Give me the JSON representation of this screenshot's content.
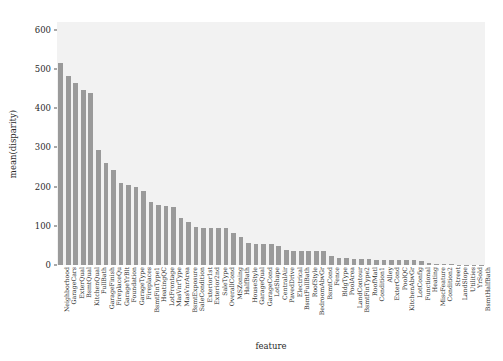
{
  "chart_data": {
    "type": "bar",
    "title": "",
    "xlabel": "feature",
    "ylabel": "mean(disparity)",
    "ylim": [
      0,
      620
    ],
    "yticks": [
      0,
      100,
      200,
      300,
      400,
      500,
      600
    ],
    "grid": false,
    "legend": null,
    "bar_color": "#9a9a9a",
    "plot_background": "#f2f2f2",
    "categories": [
      "Neighborhood",
      "GarageCars",
      "ExterQual",
      "BsmtQual",
      "KitchenQual",
      "FullBath",
      "GarageFinish",
      "FireplaceQu",
      "GarageYrBlt",
      "Foundation",
      "GarageType",
      "Fireplaces",
      "BsmtFinType1",
      "HeatingQC",
      "LotFrontage",
      "MasVnrType",
      "MasVnrArea",
      "BsmtExposure",
      "SaleCondition",
      "Exterior1st",
      "Exterior2nd",
      "SaleType",
      "OverallCond",
      "MSZoning",
      "HalfBath",
      "HouseStyle",
      "GarageQual",
      "GarageCond",
      "LotShape",
      "CentralAir",
      "PavedDrive",
      "Electrical",
      "BsmtFullBath",
      "RoofStyle",
      "BedroomAbvGr",
      "BsmtCond",
      "Fence",
      "BldgType",
      "PoolArea",
      "LandContour",
      "BsmtFinType2",
      "RoofMatl",
      "Condition1",
      "Alley",
      "ExterCond",
      "PoolQC",
      "KitchenAbvGr",
      "LotConfig",
      "Functional",
      "Heating",
      "MiscFeature",
      "Condition2",
      "Street",
      "LandSlope",
      "Utilities",
      "YrSold",
      "BsmtHalfBath"
    ],
    "values": [
      515,
      483,
      465,
      446,
      440,
      293,
      261,
      243,
      210,
      205,
      198,
      188,
      160,
      152,
      150,
      147,
      120,
      110,
      97,
      95,
      95,
      94,
      94,
      82,
      71,
      55,
      54,
      54,
      54,
      48,
      38,
      37,
      37,
      37,
      36,
      36,
      22,
      18,
      17,
      16,
      15,
      15,
      14,
      13,
      13,
      13,
      12,
      12,
      11,
      5,
      3,
      2,
      1.5,
      1,
      0.8,
      0.5,
      0.3
    ]
  }
}
